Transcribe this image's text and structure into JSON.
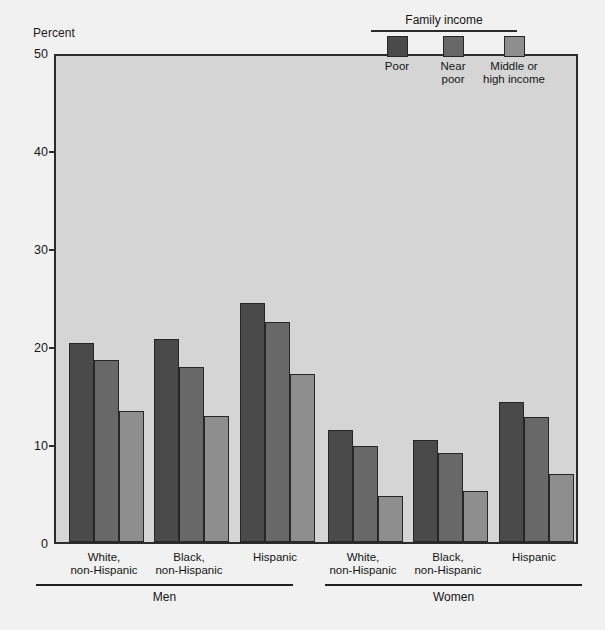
{
  "chart_data": {
    "type": "bar",
    "title": "",
    "ylabel": "Percent",
    "xlabel": "",
    "ylim": [
      0,
      50
    ],
    "yticks": [
      0,
      10,
      20,
      30,
      40,
      50
    ],
    "grid": false,
    "legend_position": "top-right",
    "legend_title": "Family income",
    "categories": [
      "White, non-Hispanic",
      "Black, non-Hispanic",
      "Hispanic",
      "White, non-Hispanic",
      "Black, non-Hispanic",
      "Hispanic"
    ],
    "groups": [
      "Men",
      "Women"
    ],
    "series": [
      {
        "name": "Poor",
        "color": "#4a4a4a",
        "values": [
          20.3,
          20.7,
          24.4,
          11.4,
          10.4,
          14.3
        ]
      },
      {
        "name": "Near poor",
        "color": "#686868",
        "values": [
          18.6,
          17.9,
          22.5,
          9.8,
          9.1,
          12.8
        ]
      },
      {
        "name": "Middle or high income",
        "color": "#8e8e8e",
        "values": [
          13.4,
          12.9,
          17.1,
          4.7,
          5.2,
          6.9
        ]
      }
    ]
  },
  "axis": {
    "y_title": "Percent",
    "y_ticks": [
      "50",
      "40",
      "30",
      "20",
      "10",
      "0"
    ]
  },
  "legend": {
    "title": "Family income",
    "entries": [
      {
        "label": "Poor",
        "color": "#4a4a4a"
      },
      {
        "label": "Near\npoor",
        "color": "#686868"
      },
      {
        "label": "Middle or\nhigh income",
        "color": "#8e8e8e"
      }
    ]
  },
  "x_axis": {
    "categories": [
      {
        "label": "White,\nnon-Hispanic"
      },
      {
        "label": "Black,\nnon-Hispanic"
      },
      {
        "label": "Hispanic"
      },
      {
        "label": "White,\nnon-Hispanic"
      },
      {
        "label": "Black,\nnon-Hispanic"
      },
      {
        "label": "Hispanic"
      }
    ],
    "groups": [
      {
        "label": "Men"
      },
      {
        "label": "Women"
      }
    ]
  }
}
